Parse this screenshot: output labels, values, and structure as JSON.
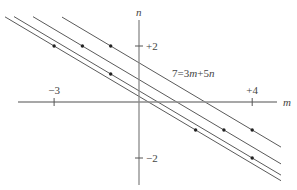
{
  "diagram": {
    "type": "lattice-lines",
    "axes": {
      "x_label": "m",
      "y_label": "n",
      "x_ticks": [
        {
          "value": -3,
          "label": "−3"
        },
        {
          "value": 4,
          "label": "+4"
        }
      ],
      "y_ticks": [
        {
          "value": 2,
          "label": "+2"
        },
        {
          "value": -2,
          "label": "−2"
        }
      ]
    },
    "family": "3m+5n=c",
    "lines": [
      {
        "c": 1
      },
      {
        "c": 2
      },
      {
        "c": 4
      },
      {
        "c": 7
      }
    ],
    "line_label": {
      "prefix": "7=3",
      "var1": "m",
      "mid": "+5",
      "var2": "n"
    },
    "points": [
      {
        "m": -3,
        "n": 2
      },
      {
        "m": -2,
        "n": 2
      },
      {
        "m": -1,
        "n": 2
      },
      {
        "m": -1,
        "n": 1
      },
      {
        "m": 2,
        "n": -1
      },
      {
        "m": 3,
        "n": -1
      },
      {
        "m": 4,
        "n": -1
      },
      {
        "m": 4,
        "n": -2
      }
    ]
  }
}
